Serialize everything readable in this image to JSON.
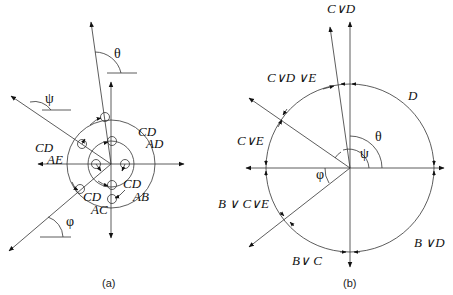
{
  "panel_a": {
    "caption": "(a)",
    "angle_labels": {
      "theta": "θ",
      "psi": "ψ",
      "phi": "φ"
    },
    "state_labels": [
      {
        "main": "CD",
        "sub": "AD"
      },
      {
        "main": "CD",
        "sub": "AE"
      },
      {
        "main": "CD",
        "sub": "AB"
      },
      {
        "main": "CD",
        "sub": "AC"
      }
    ]
  },
  "panel_b": {
    "caption": "(b)",
    "angle_labels": {
      "theta": "θ",
      "psi": "ψ",
      "phi": "φ"
    },
    "region_labels": {
      "top": "C∨D",
      "top_left": "C∨D ∨E",
      "right_upper": "D",
      "left_upper": "C∨E",
      "left_lower": "B ∨ C∨E",
      "bottom_left": "B∨ C",
      "right_lower": "B ∨D"
    }
  }
}
